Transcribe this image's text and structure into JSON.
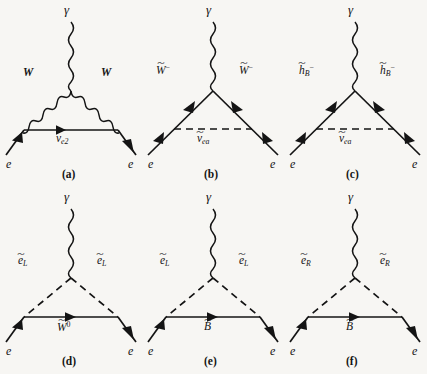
{
  "figure": {
    "title": "",
    "background_color": "#f7f6f3",
    "ink_color": "#141414",
    "columns": 3,
    "rows": 2
  },
  "panels": [
    {
      "id": "a",
      "caption": "(a)",
      "external_photon": "γ",
      "incoming_lepton": "e",
      "outgoing_lepton": "e",
      "left_leg_label": "W",
      "right_leg_label": "W",
      "left_leg_style": "wavy",
      "right_leg_style": "wavy",
      "base_label_base": "ν",
      "base_label_sub": "e2",
      "base_label_tilde": false,
      "base_label_sup": "",
      "base_style": "solid-arrow",
      "base_label_plain": "ν_e2"
    },
    {
      "id": "b",
      "caption": "(b)",
      "external_photon": "γ",
      "incoming_lepton": "e",
      "outgoing_lepton": "e",
      "left_leg_base": "W",
      "left_leg_sup": "−",
      "left_leg_tilde": true,
      "right_leg_base": "W",
      "right_leg_sup": "−",
      "right_leg_tilde": true,
      "left_leg_style": "solid-arrow",
      "right_leg_style": "solid-arrow",
      "base_label_base": "ν",
      "base_label_sub": "ea",
      "base_label_tilde": true,
      "base_label_sup": "",
      "base_style": "dashed",
      "base_label_plain": "ν̃_ea"
    },
    {
      "id": "c",
      "caption": "(c)",
      "external_photon": "γ",
      "incoming_lepton": "e",
      "outgoing_lepton": "e",
      "left_leg_base": "h",
      "left_leg_sub": "B",
      "left_leg_sup": "−",
      "left_leg_tilde": true,
      "right_leg_base": "h",
      "right_leg_sub": "B",
      "right_leg_sup": "−",
      "right_leg_tilde": true,
      "left_leg_style": "solid-arrow",
      "right_leg_style": "solid-arrow",
      "base_label_base": "ν",
      "base_label_sub": "ea",
      "base_label_tilde": true,
      "base_label_sup": "",
      "base_style": "dashed",
      "base_label_plain": "ν̃_ea"
    },
    {
      "id": "d",
      "caption": "(d)",
      "external_photon": "γ",
      "incoming_lepton": "e",
      "outgoing_lepton": "e",
      "left_leg_base": "e",
      "left_leg_sub": "L",
      "left_leg_tilde": true,
      "right_leg_base": "e",
      "right_leg_sub": "L",
      "right_leg_tilde": true,
      "left_leg_style": "dashed",
      "right_leg_style": "dashed",
      "base_label_base": "W",
      "base_label_sup": "0",
      "base_label_tilde": true,
      "base_style": "solid-arrow",
      "base_label_plain": "W̃⁰"
    },
    {
      "id": "e",
      "caption": "(e)",
      "external_photon": "γ",
      "incoming_lepton": "e",
      "outgoing_lepton": "e",
      "left_leg_base": "e",
      "left_leg_sub": "L",
      "left_leg_tilde": true,
      "right_leg_base": "e",
      "right_leg_sub": "L",
      "right_leg_tilde": true,
      "left_leg_style": "dashed",
      "right_leg_style": "dashed",
      "base_label_base": "B",
      "base_label_sup": "",
      "base_label_tilde": true,
      "base_style": "solid-arrow",
      "base_label_plain": "B̃"
    },
    {
      "id": "f",
      "caption": "(f)",
      "external_photon": "γ",
      "incoming_lepton": "e",
      "outgoing_lepton": "e",
      "left_leg_base": "e",
      "left_leg_sub": "R",
      "left_leg_tilde": true,
      "right_leg_base": "e",
      "right_leg_sub": "R",
      "right_leg_tilde": true,
      "left_leg_style": "dashed",
      "right_leg_style": "dashed",
      "base_label_base": "B",
      "base_label_sup": "",
      "base_label_tilde": true,
      "base_style": "solid-arrow",
      "base_label_plain": "B̃"
    }
  ]
}
